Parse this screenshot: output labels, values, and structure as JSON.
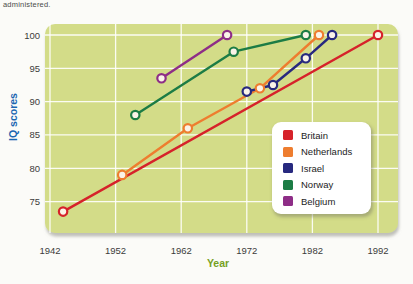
{
  "page": {
    "top_text": "administered."
  },
  "chart_data": {
    "type": "line",
    "title": "",
    "xlabel": "Year",
    "ylabel": "IQ scores",
    "xlabel_color": "#76a11f",
    "ylabel_color": "#1b67b2",
    "x_ticks": [
      1942,
      1952,
      1962,
      1972,
      1982,
      1992
    ],
    "y_ticks": [
      75,
      80,
      85,
      90,
      95,
      100
    ],
    "xlim": [
      1941,
      1995
    ],
    "ylim": [
      70,
      101.5
    ],
    "grid": true,
    "plot_bg": "#d3dc88",
    "grid_color": "#ffffff",
    "marker_fill": "#faf3e8",
    "tick_label_color": "#3b3b3b",
    "legend_position": "lower-right",
    "series": [
      {
        "name": "Britain",
        "color": "#d6222a",
        "points": [
          [
            1944,
            73.5
          ],
          [
            1992,
            100
          ]
        ]
      },
      {
        "name": "Netherlands",
        "color": "#ee7d2f",
        "points": [
          [
            1953,
            79
          ],
          [
            1963,
            86
          ],
          [
            1974,
            92
          ],
          [
            1983,
            100
          ]
        ]
      },
      {
        "name": "Israel",
        "color": "#27297f",
        "points": [
          [
            1972,
            91.5
          ],
          [
            1976,
            92.5
          ],
          [
            1981,
            96.5
          ],
          [
            1985,
            100
          ]
        ]
      },
      {
        "name": "Norway",
        "color": "#1c7c45",
        "points": [
          [
            1955,
            88
          ],
          [
            1970,
            97.5
          ],
          [
            1981,
            100
          ]
        ]
      },
      {
        "name": "Belgium",
        "color": "#8e2d87",
        "points": [
          [
            1959,
            93.5
          ],
          [
            1969,
            100
          ]
        ]
      }
    ]
  }
}
